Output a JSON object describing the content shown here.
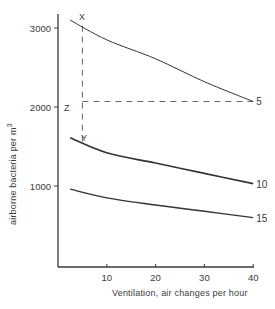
{
  "chart_data": {
    "type": "line",
    "title": "",
    "xlabel": "Ventilation, air changes per hour",
    "ylabel": "airborne bacteria per m³",
    "ylabel_text": "airborne bacteria per m",
    "ylabel_superscript": "3",
    "xlim": [
      0,
      40
    ],
    "ylim": [
      0,
      3200
    ],
    "xticks": [
      10,
      20,
      30,
      40
    ],
    "xtick_labels": [
      "10",
      "20",
      "30",
      "40"
    ],
    "yticks": [
      1000,
      2000,
      3000
    ],
    "ytick_labels": [
      "1000",
      "2000",
      "3000"
    ],
    "grid": false,
    "legend": "inline curve labels at right end",
    "x": [
      2.5,
      10,
      20,
      30,
      40
    ],
    "series": [
      {
        "name": "5",
        "values": [
          3100,
          2850,
          2610,
          2320,
          2070
        ]
      },
      {
        "name": "10",
        "values": [
          1610,
          1420,
          1290,
          1160,
          1030
        ]
      },
      {
        "name": "15",
        "values": [
          960,
          850,
          760,
          680,
          600
        ]
      }
    ],
    "annotations": [
      {
        "label": "X",
        "x": 5,
        "y": 3030,
        "note": "point on curve 5"
      },
      {
        "label": "Y",
        "x": 5,
        "y": 1560,
        "note": "point near curve 10"
      },
      {
        "label": "Z",
        "x": 5,
        "y": 2070,
        "note": "dashed horizontal from curve 5 end at 40 back to x=5"
      }
    ],
    "dashed_lines": [
      {
        "from": [
          5,
          3030
        ],
        "to": [
          5,
          1560
        ],
        "orientation": "vertical"
      },
      {
        "from": [
          5,
          2070
        ],
        "to": [
          40,
          2070
        ],
        "orientation": "horizontal"
      }
    ]
  },
  "labels": {
    "x": "X",
    "y": "Y",
    "z": "Z"
  }
}
